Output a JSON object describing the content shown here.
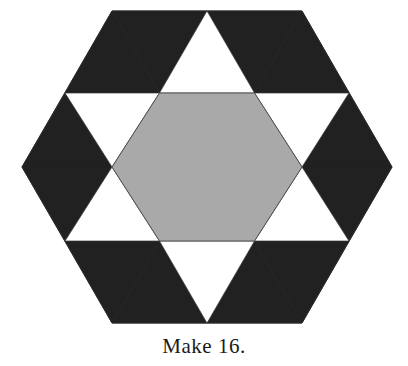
{
  "document": {
    "type": "quilt-block-diagram",
    "background_color": "#ffffff"
  },
  "caption": {
    "text": "Make 16."
  },
  "block": {
    "name": "six-pointed-star-in-hexagon",
    "outline_shape": "hexagon",
    "colors": {
      "dark": "#212121",
      "light_gray": "#a9a9a9",
      "white": "#ffffff",
      "outline": "#3a3a3a"
    },
    "pieces": {
      "center_hexagon": {
        "label": "center hexagon",
        "fill": "#a9a9a9",
        "count": 1
      },
      "star_point_triangles": {
        "label": "star point triangles",
        "fill": "#ffffff",
        "count": 6
      },
      "background_triangles": {
        "label": "background corner triangles",
        "fill": "#212121",
        "count": 12
      }
    },
    "geometry": {
      "center_x": 207,
      "center_y": 167,
      "outer_radius": 185,
      "outer_vertices": [
        [
          112,
          11
        ],
        [
          302,
          11
        ],
        [
          392,
          167
        ],
        [
          302,
          323
        ],
        [
          112,
          323
        ],
        [
          22,
          167
        ]
      ],
      "inner_hexagon_vertices": [
        [
          159.5,
          93
        ],
        [
          254.5,
          93
        ],
        [
          302,
          167
        ],
        [
          254.5,
          241
        ],
        [
          159.5,
          241
        ],
        [
          112,
          167
        ]
      ],
      "star_tip_vertices": [
        [
          207,
          11
        ],
        [
          349,
          93
        ],
        [
          349,
          241
        ],
        [
          207,
          323
        ],
        [
          65,
          241
        ],
        [
          65,
          93
        ]
      ]
    }
  }
}
